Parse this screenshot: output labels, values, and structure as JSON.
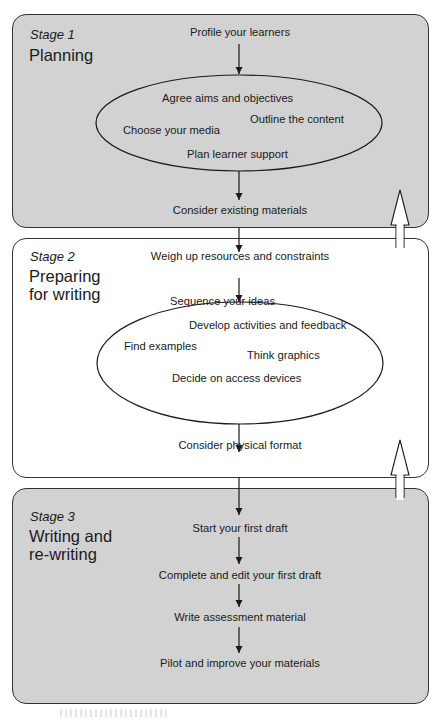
{
  "stages": [
    {
      "number": "Stage 1",
      "title_lines": [
        "Planning"
      ],
      "entry_step": "Profile your learners",
      "oval_items": [
        "Agree aims and objectives",
        "Outline the content",
        "Choose your media",
        "Plan learner support"
      ],
      "exit_step": "Consider existing materials",
      "background": "#d2d2d2"
    },
    {
      "number": "Stage 2",
      "title_lines": [
        "Preparing",
        "for writing"
      ],
      "entry_step": "Weigh up resources and constraints",
      "oval_items": [
        "Sequence your ideas",
        "Develop activities and feedback",
        "Find examples",
        "Think graphics",
        "Decide on access devices"
      ],
      "exit_step": "Consider physical format",
      "background": "#ffffff"
    },
    {
      "number": "Stage 3",
      "title_lines": [
        "Writing and",
        "re-writing"
      ],
      "steps": [
        "Start your first draft",
        "Complete and edit your first draft",
        "Write assessment material",
        "Pilot and improve your materials"
      ],
      "background": "#d2d2d2"
    }
  ],
  "connectors": {
    "down_arrows": "solid, flow between steps",
    "feedback_arrows": "hollow upward arrows on right edge from Stage 2 to Stage 1 and Stage 3 to Stage 2"
  }
}
